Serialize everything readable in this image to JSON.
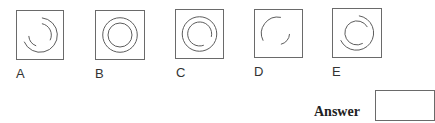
{
  "question": {
    "options": [
      {
        "label": "A",
        "description": "outer arc from ~12:30 clockwise to ~8:30; inner arcs at upper-right and lower-left"
      },
      {
        "label": "B",
        "description": "two full concentric circles"
      },
      {
        "label": "C",
        "description": "outer full circle; inner nearly full arc with gap at lower right"
      },
      {
        "label": "D",
        "description": "upper-left outer arc and lower-right inner arc"
      },
      {
        "label": "E",
        "description": "outer arc from ~12:30 clockwise to ~8:30; inner arc from ~5 o'clock clockwise to ~2 o'clock"
      }
    ],
    "answer_label": "Answer",
    "answer_value": ""
  },
  "colors": {
    "stroke": "#6a6a6a",
    "text": "#333333"
  }
}
